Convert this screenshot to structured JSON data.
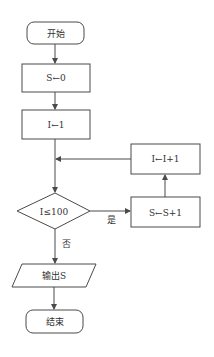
{
  "diagram": {
    "type": "flowchart",
    "nodes": {
      "start": {
        "label": "开始",
        "shape": "terminal"
      },
      "init_s": {
        "label": "S←0",
        "shape": "process"
      },
      "init_i": {
        "label": "I←1",
        "shape": "process"
      },
      "condition": {
        "label": "I≤100",
        "shape": "decision"
      },
      "update_s": {
        "label": "S←S+1",
        "shape": "process"
      },
      "update_i": {
        "label": "I←I+1",
        "shape": "process"
      },
      "output": {
        "label": "输出S",
        "shape": "io"
      },
      "end": {
        "label": "结束",
        "shape": "terminal"
      }
    },
    "edge_labels": {
      "yes": "是",
      "no": "否"
    },
    "colors": {
      "stroke": "#4a4a4a",
      "text": "#333333",
      "background": "#ffffff"
    }
  }
}
